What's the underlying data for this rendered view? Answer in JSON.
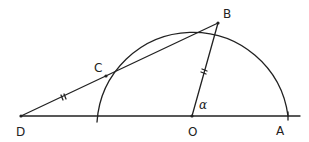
{
  "diagram": {
    "type": "geometry",
    "points": {
      "D": {
        "label": "D",
        "x": 21,
        "y": 116
      },
      "C": {
        "label": "C",
        "x": 106,
        "y": 76
      },
      "B": {
        "label": "B",
        "x": 218,
        "y": 23
      },
      "O": {
        "label": "O",
        "x": 192,
        "y": 116
      },
      "A": {
        "label": "A",
        "x": 288,
        "y": 116
      }
    },
    "angle_label": "α",
    "tick_marks": [
      "DC",
      "OB"
    ],
    "colors": {
      "stroke": "#222222",
      "background": "#ffffff"
    }
  }
}
